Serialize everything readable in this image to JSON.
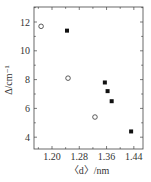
{
  "chart_data": {
    "type": "scatter",
    "title": "",
    "xlabel": "〈d〉/nm",
    "ylabel": "Δ/cm⁻¹",
    "xlim": [
      1.12,
      1.47
    ],
    "ylim": [
      3.0,
      13.0
    ],
    "xticks": [
      "1.20",
      "1.28",
      "1.36",
      "1.44"
    ],
    "yticks": [
      "4",
      "6",
      "8",
      "10",
      "12"
    ],
    "grid": false,
    "legend": null,
    "series": [
      {
        "name": "open circles",
        "marker": "circle-open",
        "x": [
          1.168,
          1.247,
          1.326
        ],
        "y": [
          11.7,
          8.1,
          5.4
        ]
      },
      {
        "name": "filled squares",
        "marker": "square-filled",
        "x": [
          1.244,
          1.355,
          1.363,
          1.375,
          1.432
        ],
        "y": [
          11.4,
          7.8,
          7.2,
          6.5,
          4.4
        ]
      }
    ]
  }
}
